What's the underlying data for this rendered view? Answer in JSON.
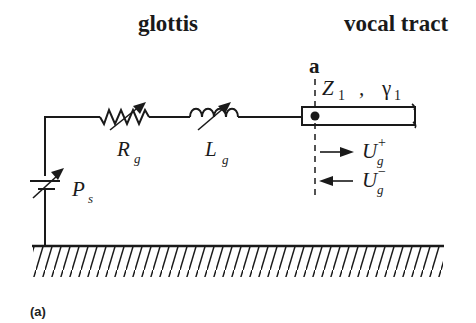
{
  "diagram": {
    "type": "equivalent-circuit",
    "headings": {
      "left": "glottis",
      "right": "vocal tract"
    },
    "node": {
      "label": "a"
    },
    "components": [
      {
        "id": "Ps",
        "kind": "variable-pressure-source",
        "symbol": "P",
        "subscript": "s"
      },
      {
        "id": "Rg",
        "kind": "variable-resistor",
        "symbol": "R",
        "subscript": "g"
      },
      {
        "id": "Lg",
        "kind": "variable-inductor",
        "symbol": "L",
        "subscript": "g"
      },
      {
        "id": "tube",
        "kind": "transmission-line",
        "impedance_symbol": "Z",
        "impedance_subscript": "1",
        "separator": ",",
        "propagation_symbol": "γ",
        "propagation_subscript": "1"
      }
    ],
    "waves": [
      {
        "direction": "forward",
        "symbol": "U",
        "subscript": "g",
        "superscript": "+"
      },
      {
        "direction": "backward",
        "symbol": "U",
        "subscript": "g",
        "superscript": "−"
      }
    ],
    "ground": "hatched-ground",
    "caption": "(a)",
    "colors": {
      "ink": "#1a1a1a",
      "background": "#ffffff"
    }
  }
}
